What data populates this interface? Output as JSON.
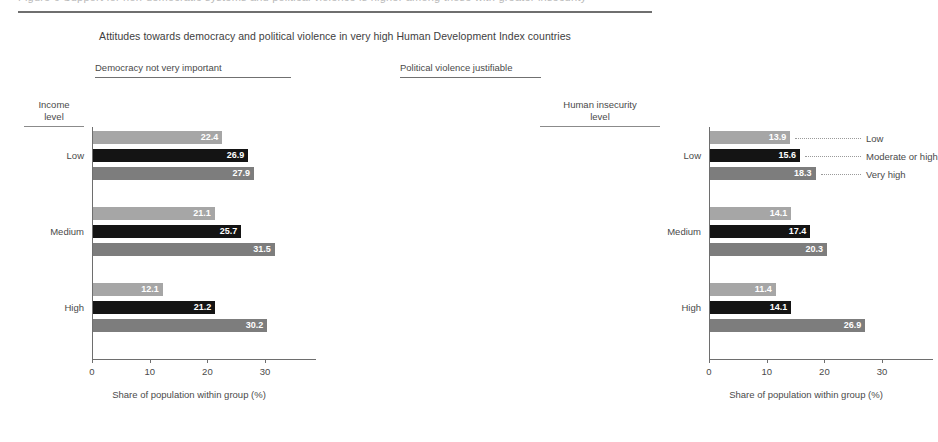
{
  "page": {
    "top_cropped_text": "Figure 6 Support for non-democratic systems and political violence is higher among those with greater insecurity",
    "title": "Attitudes towards democracy and political violence in very high Human Development Index countries"
  },
  "axes_headers": {
    "income_level": "Income\nlevel",
    "income_level_line1": "Income",
    "income_level_line2": "level",
    "human_insecurity_line1": "Human insecurity",
    "human_insecurity_line2": "level"
  },
  "legend": {
    "title_line1": "Human insecurity",
    "title_line2": "level",
    "items": [
      {
        "label": "Low",
        "color": "#a6a6a6"
      },
      {
        "label": "Moderate or high",
        "color": "#141414"
      },
      {
        "label": "Very high",
        "color": "#7d7d7d"
      }
    ]
  },
  "chart_data": {
    "type": "bar",
    "orientation": "horizontal",
    "title": "Attitudes towards democracy and political violence in very high Human Development Index countries",
    "xlabel": "Share of population within group (%)",
    "ylabel": "Income level",
    "xlim": [
      0,
      38.5
    ],
    "xticks": [
      0,
      10,
      20,
      30
    ],
    "xtick_labels": [
      "0",
      "10",
      "20",
      "30"
    ],
    "grid": false,
    "legend_position": "right",
    "categories": [
      "Low",
      "Medium",
      "High"
    ],
    "series": [
      {
        "name": "Low",
        "color": "#a6a6a6"
      },
      {
        "name": "Moderate or high",
        "color": "#141414"
      },
      {
        "name": "Very high",
        "color": "#7d7d7d"
      }
    ],
    "panels": [
      {
        "name": "democracy-not-very-important",
        "title": "Democracy not very important",
        "xlabel": "Share of population within group (%)",
        "groups": [
          {
            "category": "Low",
            "values": [
              22.4,
              26.9,
              27.9
            ]
          },
          {
            "category": "Medium",
            "values": [
              21.1,
              25.7,
              31.5
            ]
          },
          {
            "category": "High",
            "values": [
              12.1,
              21.2,
              30.2
            ]
          }
        ]
      },
      {
        "name": "political-violence-justifiable",
        "title": "Political violence justifiable",
        "xlabel": "Share of population within group (%)",
        "groups": [
          {
            "category": "Low",
            "values": [
              13.9,
              15.6,
              18.3
            ]
          },
          {
            "category": "Medium",
            "values": [
              14.1,
              17.4,
              20.3
            ]
          },
          {
            "category": "High",
            "values": [
              11.4,
              14.1,
              26.9
            ]
          }
        ]
      }
    ]
  }
}
